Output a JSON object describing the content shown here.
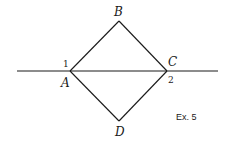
{
  "figure": {
    "caption": "Ex. 5",
    "points": {
      "A": {
        "label": "A",
        "x": 70,
        "y": 71
      },
      "B": {
        "label": "B",
        "x": 119,
        "y": 21
      },
      "C": {
        "label": "C",
        "x": 167,
        "y": 71
      },
      "D": {
        "label": "D",
        "x": 119,
        "y": 121
      }
    },
    "angle_labels": {
      "angle1": "1",
      "angle2": "2"
    },
    "line": {
      "x1": 17,
      "y1": 71,
      "x2": 218,
      "y2": 71
    },
    "stroke_color": "#1a1a1a",
    "background": "#ffffff"
  }
}
